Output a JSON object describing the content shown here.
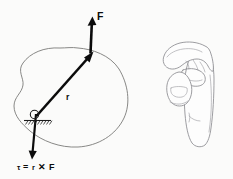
{
  "figure": {
    "background_color": "#fbfbfa",
    "ink_color": "#0b0b0b",
    "outline_color": "#7a7a78",
    "hand_color": "#8b8b90"
  },
  "labels": {
    "force": "F",
    "radius": "r",
    "torque_equation_tau": "τ",
    "torque_equation_eq": "=",
    "torque_equation_r": "r",
    "torque_equation_cross": "✕",
    "torque_equation_f": "F",
    "torque_equation_full": "τ = r ✕ F"
  },
  "elements": {
    "rigid_body": "irregular-blob-outline",
    "pivot": "pivot-point-with-hatched-ground",
    "force_vector": "force-arrow-up",
    "radius_vector": "position-vector-arrow",
    "torque_vector": "torque-arrow-down",
    "hand": "right-hand-rule-illustration"
  },
  "geometry": {
    "pivot_x": 36,
    "pivot_y": 117,
    "force_application_x": 93,
    "force_application_y": 52,
    "force_tip_x": 92,
    "force_tip_y": 17,
    "torque_tip_x": 32,
    "torque_tip_y": 159
  }
}
